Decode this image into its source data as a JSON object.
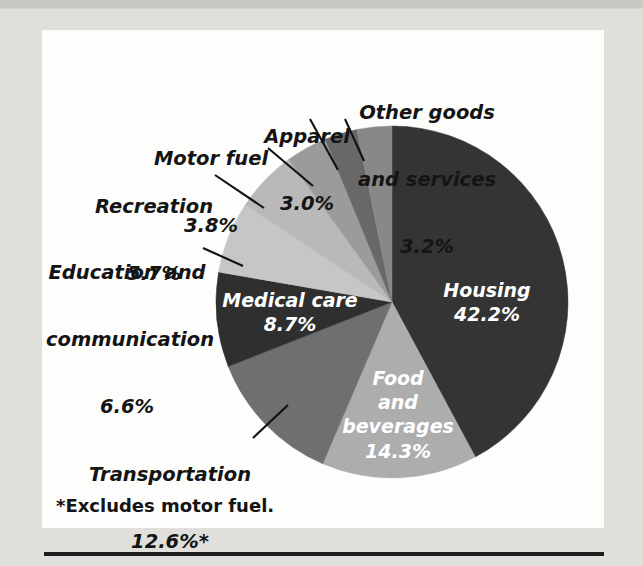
{
  "figure": {
    "footnote": "*Excludes motor fuel.",
    "background_color": "#e0dfdb",
    "panel_color": "#fdfdfc",
    "rule_color": "#1d1d1d"
  },
  "chart_data": {
    "type": "pie",
    "title": "",
    "subtitle": "",
    "xlabel": "",
    "ylabel": "",
    "grid": false,
    "legend_position": "none",
    "label_format": "name + percent",
    "start_angle_deg": 0,
    "direction": "clockwise",
    "units": "percent of consumer spending",
    "total": 100.1,
    "categories": [
      "Housing",
      "Food and beverages",
      "Transportation",
      "Medical care",
      "Education and communication",
      "Recreation",
      "Motor fuel",
      "Apparel",
      "Other goods and services"
    ],
    "values": [
      42.2,
      14.3,
      12.6,
      8.7,
      6.6,
      5.7,
      3.8,
      3.0,
      3.2
    ],
    "slices": [
      {
        "name": "Housing",
        "percent": 42.2,
        "percent_text": "42.2%",
        "label_line1": "Housing",
        "label_line2": "42.2%",
        "color": "#343434",
        "label_placement": "inside",
        "label_color": "#ffffff"
      },
      {
        "name": "Food and beverages",
        "percent": 14.3,
        "percent_text": "14.3%",
        "label_line1": "Food",
        "label_line2": "and",
        "label_line3": "beverages",
        "label_line4": "14.3%",
        "color": "#adadad",
        "label_placement": "inside",
        "label_color": "#ffffff"
      },
      {
        "name": "Transportation",
        "percent": 12.6,
        "percent_text": "12.6%*",
        "label_line1": "Transportation",
        "label_line2": "12.6%*",
        "color": "#6f6f6f",
        "label_placement": "outside",
        "label_color": "#141414",
        "footnote_marker": "*"
      },
      {
        "name": "Medical care",
        "percent": 8.7,
        "percent_text": "8.7%",
        "label_line1": "Medical care",
        "label_line2": "8.7%",
        "color": "#2f2f2f",
        "label_placement": "inside",
        "label_color": "#ffffff"
      },
      {
        "name": "Education and communication",
        "percent": 6.6,
        "percent_text": "6.6%",
        "label_line1": "Education and",
        "label_line2": "communication",
        "label_line3": "6.6%",
        "color": "#c6c6c6",
        "label_placement": "outside",
        "label_color": "#141414"
      },
      {
        "name": "Recreation",
        "percent": 5.7,
        "percent_text": "5.7%",
        "label_line1": "Recreation",
        "label_line2": "5.7%",
        "color": "#b9b9b9",
        "label_placement": "outside",
        "label_color": "#141414"
      },
      {
        "name": "Motor fuel",
        "percent": 3.8,
        "percent_text": "3.8%",
        "label_line1": "Motor fuel",
        "label_line2": "3.8%",
        "color": "#9b9b9b",
        "label_placement": "outside",
        "label_color": "#141414"
      },
      {
        "name": "Apparel",
        "percent": 3.0,
        "percent_text": "3.0%",
        "label_line1": "Apparel",
        "label_line2": "3.0%",
        "color": "#686868",
        "label_placement": "outside",
        "label_color": "#141414"
      },
      {
        "name": "Other goods and services",
        "percent": 3.2,
        "percent_text": "3.2%",
        "label_line1": "Other goods",
        "label_line2": "and services",
        "label_line3": "3.2%",
        "color": "#888888",
        "label_placement": "outside",
        "label_color": "#141414"
      }
    ]
  }
}
